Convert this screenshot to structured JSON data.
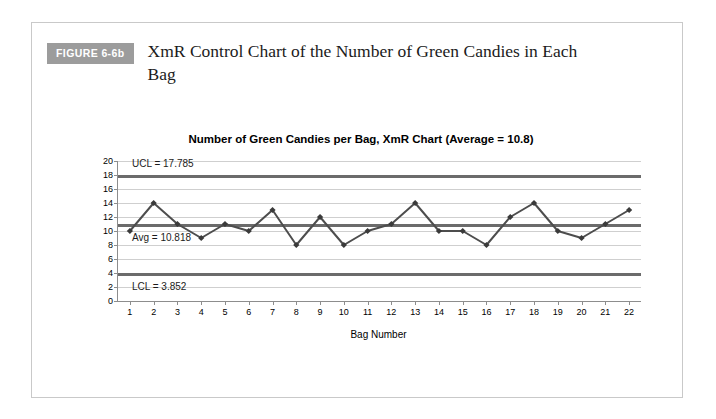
{
  "figure": {
    "badge_label": "FIGURE 6-6b",
    "caption": "XmR Control Chart of the Number of Green Candies in Each Bag"
  },
  "chart_data": {
    "type": "line",
    "title": "Number of Green Candies per Bag, XmR Chart (Average = 10.8)",
    "xlabel": "Bag Number",
    "ylabel": "Number of Green Candies",
    "categories": [
      1,
      2,
      3,
      4,
      5,
      6,
      7,
      8,
      9,
      10,
      11,
      12,
      13,
      14,
      15,
      16,
      17,
      18,
      19,
      20,
      21,
      22
    ],
    "values": [
      10,
      14,
      11,
      9,
      11,
      10,
      13,
      8,
      12,
      8,
      10,
      11,
      14,
      10,
      10,
      8,
      12,
      14,
      10,
      9,
      11,
      13
    ],
    "series": [
      {
        "name": "Number of Green Candies",
        "values": [
          10,
          14,
          11,
          9,
          11,
          10,
          13,
          8,
          12,
          8,
          10,
          11,
          14,
          10,
          10,
          8,
          12,
          14,
          10,
          9,
          11,
          13
        ]
      }
    ],
    "ylim": [
      0,
      20
    ],
    "ytick_step": 2,
    "yticks": [
      0,
      2,
      4,
      6,
      8,
      10,
      12,
      14,
      16,
      18,
      20
    ],
    "xlim": [
      1,
      22
    ],
    "grid": true,
    "legend": "none",
    "marker": "diamond",
    "line_color": "#4d4d4d",
    "marker_color": "#3a3a3a",
    "grid_color": "#cfcfcf",
    "limit_line_color": "#6b6b6b",
    "control_limits": {
      "ucl": {
        "label": "UCL = 17.785",
        "value": 17.785
      },
      "avg": {
        "label": "Avg = 10.818",
        "value": 10.818
      },
      "lcl": {
        "label": "LCL = 3.852",
        "value": 3.852
      }
    }
  }
}
